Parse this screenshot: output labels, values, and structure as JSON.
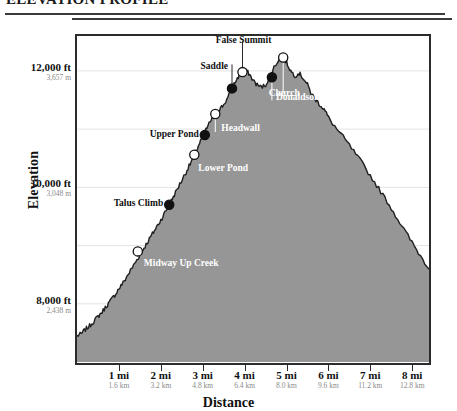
{
  "header": {
    "title": "ELEVATION PROFILE"
  },
  "axes": {
    "ylabel": "Elevation",
    "xlabel": "Distance",
    "yticks": [
      {
        "ft": "12,000 ft",
        "m": "3,657 m",
        "value": 12000
      },
      {
        "ft": "10,000 ft",
        "m": "3,048 m",
        "value": 10000
      },
      {
        "ft": "8,000 ft",
        "m": "2,438 m",
        "value": 8000
      }
    ],
    "xticks": [
      {
        "mi": "1 mi",
        "km": "1.6 km",
        "value": 1
      },
      {
        "mi": "2 mi",
        "km": "3.2 km",
        "value": 2
      },
      {
        "mi": "3 mi",
        "km": "4.8 km",
        "value": 3
      },
      {
        "mi": "4 mi",
        "km": "6.4 km",
        "value": 4
      },
      {
        "mi": "5 mi",
        "km": "8.0 km",
        "value": 5
      },
      {
        "mi": "6 mi",
        "km": "9.6 km",
        "value": 6
      },
      {
        "mi": "7 mi",
        "km": "11.2 km",
        "value": 7
      },
      {
        "mi": "8 mi",
        "km": "12.8 km",
        "value": 8
      }
    ]
  },
  "waypoints": [
    {
      "label": "Midway Up Creek",
      "marker": "hollow",
      "tone": "light"
    },
    {
      "label": "Talus Climb",
      "marker": "filled",
      "tone": "dark"
    },
    {
      "label": "Lower Pond",
      "marker": "hollow",
      "tone": "light"
    },
    {
      "label": "Upper Pond",
      "marker": "filled",
      "tone": "dark"
    },
    {
      "label": "Headwall",
      "marker": "hollow",
      "tone": "light"
    },
    {
      "label": "Saddle",
      "marker": "filled",
      "tone": "dark"
    },
    {
      "label": "False Summit",
      "marker": "hollow",
      "tone": "dark"
    },
    {
      "label": "Donaldson",
      "marker": "filled",
      "tone": "light"
    },
    {
      "label": "Church",
      "marker": "hollow",
      "tone": "light"
    }
  ],
  "chart_data": {
    "type": "area",
    "title": "ELEVATION PROFILE",
    "xlabel": "Distance",
    "ylabel": "Elevation",
    "x_unit": "mi",
    "y_unit": "ft",
    "xlim": [
      0,
      8.4
    ],
    "ylim": [
      7000,
      12600
    ],
    "grid": true,
    "gridlines_y": [
      8000,
      9000,
      10000,
      11000,
      12000
    ],
    "fill_color": "#969696",
    "line_color": "#1f1f1f",
    "x": [
      0.0,
      0.1,
      0.2,
      0.3,
      0.4,
      0.5,
      0.6,
      0.7,
      0.8,
      0.9,
      1.0,
      1.1,
      1.2,
      1.3,
      1.4,
      1.5,
      1.6,
      1.7,
      1.8,
      1.9,
      2.0,
      2.1,
      2.2,
      2.3,
      2.4,
      2.5,
      2.6,
      2.7,
      2.8,
      2.9,
      3.0,
      3.1,
      3.2,
      3.3,
      3.4,
      3.5,
      3.6,
      3.7,
      3.8,
      3.9,
      4.0,
      4.1,
      4.2,
      4.3,
      4.4,
      4.5,
      4.6,
      4.7,
      4.8,
      4.9,
      5.0,
      5.1,
      5.2,
      5.3,
      5.4,
      5.5,
      5.6,
      5.7,
      5.8,
      5.9,
      6.0,
      6.2,
      6.4,
      6.6,
      6.8,
      7.0,
      7.2,
      7.4,
      7.6,
      7.8,
      8.0,
      8.2,
      8.4
    ],
    "y": [
      7450,
      7480,
      7560,
      7620,
      7700,
      7780,
      7860,
      7960,
      8050,
      8150,
      8260,
      8360,
      8480,
      8600,
      8720,
      8840,
      8960,
      9080,
      9200,
      9320,
      9440,
      9570,
      9700,
      9840,
      9980,
      10120,
      10260,
      10400,
      10560,
      10720,
      10880,
      11020,
      11160,
      11260,
      11340,
      11420,
      11540,
      11700,
      11840,
      11960,
      12020,
      11960,
      11840,
      11760,
      11720,
      11760,
      11900,
      12060,
      12180,
      12240,
      12150,
      12000,
      11920,
      11960,
      11880,
      11760,
      11600,
      11500,
      11420,
      11340,
      11200,
      11000,
      10820,
      10620,
      10420,
      10200,
      9980,
      9760,
      9520,
      9280,
      9050,
      8820,
      8600
    ],
    "waypoints": [
      {
        "label": "Midway Up Creek",
        "x": 1.45,
        "y": 8900,
        "marker": "hollow"
      },
      {
        "label": "Talus Climb",
        "x": 2.2,
        "y": 9700,
        "marker": "filled"
      },
      {
        "label": "Lower Pond",
        "x": 2.8,
        "y": 10560,
        "marker": "hollow"
      },
      {
        "label": "Upper Pond",
        "x": 3.05,
        "y": 10900,
        "marker": "filled"
      },
      {
        "label": "Headwall",
        "x": 3.3,
        "y": 11260,
        "marker": "hollow"
      },
      {
        "label": "Saddle",
        "x": 3.7,
        "y": 11700,
        "marker": "filled"
      },
      {
        "label": "False Summit",
        "x": 3.95,
        "y": 11980,
        "marker": "hollow"
      },
      {
        "label": "Donaldson",
        "x": 4.65,
        "y": 11890,
        "marker": "filled"
      },
      {
        "label": "Church",
        "x": 4.92,
        "y": 12230,
        "marker": "hollow"
      }
    ]
  }
}
